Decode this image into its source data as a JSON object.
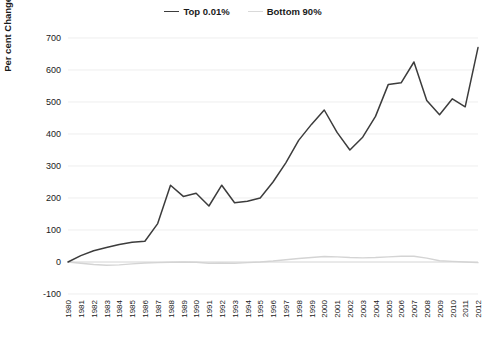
{
  "chart_data": {
    "type": "line",
    "title": "",
    "xlabel": "",
    "ylabel": "Per cent Change since 1980",
    "ylim": [
      -100,
      700
    ],
    "ytick_step": 100,
    "yticks": [
      -100,
      0,
      100,
      200,
      300,
      400,
      500,
      600,
      700
    ],
    "grid": true,
    "legend_position": "top-center",
    "x": [
      1980,
      1981,
      1982,
      1983,
      1984,
      1985,
      1986,
      1987,
      1988,
      1989,
      1990,
      1991,
      1992,
      1993,
      1994,
      1995,
      1996,
      1997,
      1998,
      1999,
      2000,
      2001,
      2002,
      2003,
      2004,
      2005,
      2006,
      2007,
      2008,
      2009,
      2010,
      2011,
      2012
    ],
    "categories": [
      "1980",
      "1981",
      "1982",
      "1983",
      "1984",
      "1985",
      "1986",
      "1987",
      "1988",
      "1989",
      "1990",
      "1991",
      "1992",
      "1993",
      "1994",
      "1995",
      "1996",
      "1997",
      "1998",
      "1999",
      "2000",
      "2001",
      "2002",
      "2003",
      "2004",
      "2005",
      "2006",
      "2007",
      "2008",
      "2009",
      "2010",
      "2011",
      "2012"
    ],
    "series": [
      {
        "name": "Top 0.01%",
        "color": "#3c3c3c",
        "values": [
          0,
          20,
          35,
          45,
          55,
          62,
          65,
          120,
          240,
          205,
          215,
          175,
          240,
          185,
          190,
          200,
          250,
          310,
          380,
          430,
          475,
          405,
          350,
          390,
          455,
          555,
          560,
          625,
          505,
          460,
          510,
          485,
          670
        ]
      },
      {
        "name": "Bottom 90%",
        "color": "#d4d4d4",
        "values": [
          0,
          -4,
          -8,
          -10,
          -9,
          -6,
          -3,
          -2,
          -1,
          0,
          -1,
          -4,
          -3,
          -4,
          -2,
          0,
          3,
          7,
          11,
          14,
          17,
          16,
          14,
          13,
          14,
          16,
          18,
          18,
          12,
          4,
          2,
          0,
          -2
        ]
      }
    ]
  },
  "legend": {
    "entries": [
      {
        "label": "Top 0.01%",
        "color": "#3c3c3c"
      },
      {
        "label": "Bottom 90%",
        "color": "#d9d9d9"
      }
    ]
  },
  "axes": {
    "y_title": "Per cent Change since 1980"
  }
}
